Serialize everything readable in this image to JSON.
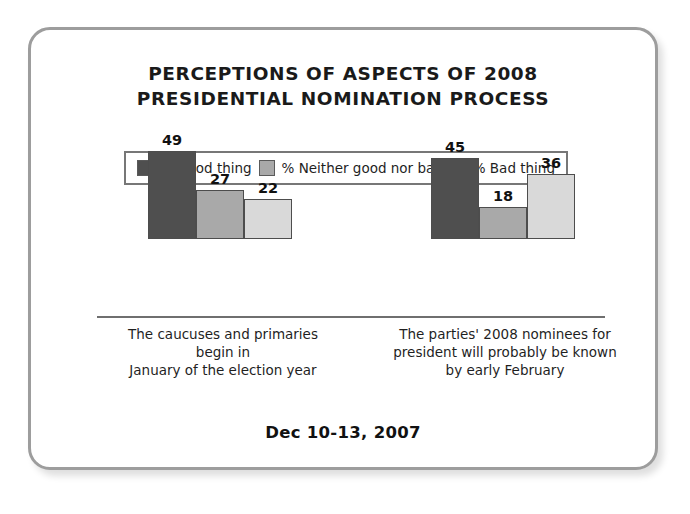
{
  "chart_data": {
    "type": "bar",
    "title": "PERCEPTIONS OF ASPECTS OF 2008 PRESIDENTIAL NOMINATION PROCESS",
    "title_lines": [
      "PERCEPTIONS OF ASPECTS OF 2008",
      "PRESIDENTIAL NOMINATION PROCESS"
    ],
    "xlabel": "",
    "ylabel": "",
    "ylim": [
      0,
      50
    ],
    "grid": false,
    "legend_position": "top-center",
    "categories": [
      "The caucuses and primaries begin in January of the election year",
      "The parties' 2008 nominees for president will probably be known by early February"
    ],
    "category_lines": [
      [
        "The caucuses and primaries begin in",
        "January of the election year"
      ],
      [
        "The parties' 2008 nominees for",
        "president will probably be known",
        "by early February"
      ]
    ],
    "series": [
      {
        "name": "% Good thing",
        "color": "#4f4f4f",
        "values": [
          49,
          45
        ]
      },
      {
        "name": "% Neither good nor bad",
        "color": "#a9a9a9",
        "values": [
          27,
          18
        ]
      },
      {
        "name": "% Bad thing",
        "color": "#d9d9d9",
        "values": [
          22,
          36
        ]
      }
    ],
    "footnote": "Dec 10-13, 2007"
  },
  "legend": {
    "items": [
      {
        "label": "% Good thing",
        "color": "#4f4f4f"
      },
      {
        "label": "% Neither good nor bad",
        "color": "#a9a9a9"
      },
      {
        "label": "% Bad thing",
        "color": "#d9d9d9"
      }
    ]
  },
  "colors": {
    "good": "#4f4f4f",
    "neither": "#a9a9a9",
    "bad": "#d9d9d9",
    "border": "#9d9d9d",
    "axis": "#6f6f6f",
    "text": "#1a1a1a"
  }
}
